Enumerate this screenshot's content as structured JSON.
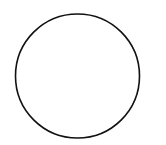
{
  "canvas": {
    "width": 166,
    "height": 145,
    "background": "#ffffff"
  },
  "shapes": [
    {
      "type": "circle",
      "cx": 77.5,
      "cy": 76,
      "r": 62,
      "fill": "none",
      "stroke": "#111111",
      "stroke_width": 1.6
    }
  ]
}
